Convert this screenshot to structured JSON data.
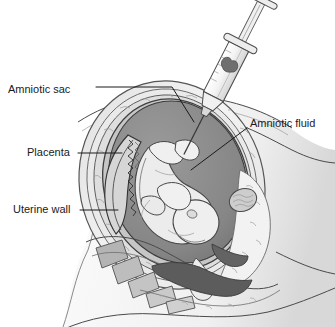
{
  "figure": {
    "background_color": "#ffffff",
    "width": 335,
    "height": 327,
    "style": "grayscale medical line illustration"
  },
  "labels": [
    {
      "id": "amniotic-sac",
      "text": "Amniotic sac",
      "text_x": 8,
      "text_y": 90,
      "anchor": "start",
      "leader_path": "M96,87 L172,87 L194,122",
      "target_x": 194,
      "target_y": 122
    },
    {
      "id": "placenta",
      "text": "Placenta",
      "text_x": 27,
      "text_y": 153,
      "anchor": "start",
      "leader_path": "M78,153 L122,153",
      "target_x": 122,
      "target_y": 153
    },
    {
      "id": "uterine-wall",
      "text": "Uterine wall",
      "text_x": 13,
      "text_y": 210,
      "anchor": "start",
      "leader_path": "M80,210 L118,210",
      "target_x": 118,
      "target_y": 210
    },
    {
      "id": "amniotic-fluid",
      "text": "Amniotic fluid",
      "text_x": 250,
      "text_y": 124,
      "anchor": "start",
      "leader_path": "M247,128 L191,170",
      "target_x": 191,
      "target_y": 170
    }
  ],
  "anatomy": {
    "maternal_abdomen": {
      "name": "maternal abdomen",
      "fill": "#fbfbfb",
      "shade": "#e3e3e3"
    },
    "uterine_wall": {
      "name": "uterine wall",
      "fill": "#f2f2f2",
      "stroke": "#5a5a5a"
    },
    "amniotic_sac_membrane": {
      "name": "amniotic sac membrane",
      "fill": "#cfcfcf",
      "stroke": "#4f4f4f"
    },
    "amniotic_fluid": {
      "name": "amniotic fluid cavity",
      "fill": "#8b8b8b",
      "stroke": "#3f3f3f"
    },
    "placenta": {
      "name": "placenta",
      "fill": "#d8d8d8",
      "stroke": "#3a3a3a",
      "texture": "villous zigzag"
    },
    "fetus": {
      "name": "fetus",
      "fill": "#ededed",
      "stroke": "#4a4a4a",
      "position": "head down, curled"
    },
    "pelvic_bone": {
      "name": "sacral vertebrae",
      "fill": "#b9b9b9",
      "stroke": "#555555"
    },
    "bladder_canal": {
      "name": "dark visceral canal",
      "fill": "#5d5d5d",
      "stroke": "#3a3a3a"
    },
    "cervix": {
      "name": "cervix",
      "fill": "#e8e8e8",
      "stroke": "#555555"
    }
  },
  "instrument": {
    "name": "syringe",
    "parts": {
      "plunger": "plunger rod",
      "plunger_flange": "thumb rest",
      "barrel_flange": "finger flange",
      "barrel": "barrel",
      "barrel_fill": "#f6f6f6",
      "fluid_marker": "#6f6f6f",
      "hub": "needle hub",
      "needle": "needle"
    },
    "needle_tip_x": 203,
    "needle_tip_y": 134,
    "angle_description": "tilted, entering lower-left"
  }
}
